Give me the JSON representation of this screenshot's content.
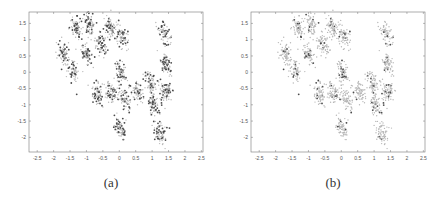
{
  "chart_data": [
    {
      "type": "scatter",
      "panel": "a",
      "caption": "(a)",
      "title": "",
      "xlabel": "",
      "ylabel": "",
      "xlim": [
        -2.75,
        2.55
      ],
      "ylim": [
        -2.45,
        1.85
      ],
      "xticks": [
        -2.5,
        -2,
        -1.5,
        -1,
        -0.5,
        0,
        0.5,
        1,
        1.5,
        2,
        2.5
      ],
      "yticks": [
        1.5,
        1,
        0.5,
        0,
        -0.5,
        -1,
        -1.5,
        -2
      ],
      "xtick_labels": [
        "-2.5",
        "-2",
        "-1.5",
        "-1",
        "-0.5",
        "0",
        "0.5",
        "1",
        "1.5",
        "2",
        "2.5"
      ],
      "ytick_labels": [
        "1.5",
        "1",
        "0.5",
        "0",
        "-0.5",
        "-1",
        "-1.5",
        "-2"
      ],
      "grid": false,
      "style": "dense gray points with many darker highlighted points",
      "clusters": [
        {
          "x": -1.3,
          "y": 1.35
        },
        {
          "x": -0.9,
          "y": 1.45
        },
        {
          "x": -1.7,
          "y": 0.55
        },
        {
          "x": -1.4,
          "y": 0.05
        },
        {
          "x": -1.0,
          "y": 0.55
        },
        {
          "x": -0.55,
          "y": 0.85
        },
        {
          "x": -0.25,
          "y": 1.35
        },
        {
          "x": 0.1,
          "y": 1.1
        },
        {
          "x": 1.35,
          "y": 1.2
        },
        {
          "x": 0.05,
          "y": 0.0
        },
        {
          "x": 1.4,
          "y": 0.25
        },
        {
          "x": 0.95,
          "y": -0.35
        },
        {
          "x": 1.4,
          "y": -0.55
        },
        {
          "x": -0.65,
          "y": -0.65
        },
        {
          "x": -0.25,
          "y": -0.65
        },
        {
          "x": 0.15,
          "y": -0.8
        },
        {
          "x": 0.55,
          "y": -0.6
        },
        {
          "x": 1.05,
          "y": -1.0
        },
        {
          "x": 0.05,
          "y": -1.7
        },
        {
          "x": 1.25,
          "y": -1.9
        }
      ]
    },
    {
      "type": "scatter",
      "panel": "b",
      "caption": "(b)",
      "title": "",
      "xlabel": "",
      "ylabel": "",
      "xlim": [
        -2.75,
        2.55
      ],
      "ylim": [
        -2.45,
        1.85
      ],
      "xticks": [
        -2.5,
        -2,
        -1.5,
        -1,
        -0.5,
        0,
        0.5,
        1,
        1.5,
        2,
        2.5
      ],
      "yticks": [
        1.5,
        1,
        0.5,
        0,
        -0.5,
        -1,
        -1.5,
        -2
      ],
      "xtick_labels": [
        "-2.5",
        "-2",
        "-1.5",
        "-1",
        "-0.5",
        "0",
        "0.5",
        "1",
        "1.5",
        "2",
        "2.5"
      ],
      "ytick_labels": [
        "1.5",
        "1",
        "0.5",
        "0",
        "-0.5",
        "-1",
        "-1.5",
        "-2"
      ],
      "grid": false,
      "style": "dense light gray points with few darker highlighted points",
      "clusters": [
        {
          "x": -1.3,
          "y": 1.35
        },
        {
          "x": -0.9,
          "y": 1.45
        },
        {
          "x": -1.7,
          "y": 0.55
        },
        {
          "x": -1.4,
          "y": 0.05
        },
        {
          "x": -1.0,
          "y": 0.55
        },
        {
          "x": -0.55,
          "y": 0.85
        },
        {
          "x": -0.25,
          "y": 1.35
        },
        {
          "x": 0.1,
          "y": 1.1
        },
        {
          "x": 1.35,
          "y": 1.2
        },
        {
          "x": 0.05,
          "y": 0.0
        },
        {
          "x": 1.4,
          "y": 0.25
        },
        {
          "x": 0.95,
          "y": -0.35
        },
        {
          "x": 1.4,
          "y": -0.55
        },
        {
          "x": -0.65,
          "y": -0.65
        },
        {
          "x": -0.25,
          "y": -0.65
        },
        {
          "x": 0.15,
          "y": -0.8
        },
        {
          "x": 0.55,
          "y": -0.6
        },
        {
          "x": 1.05,
          "y": -1.0
        },
        {
          "x": 0.05,
          "y": -1.7
        },
        {
          "x": 1.25,
          "y": -1.9
        }
      ]
    }
  ],
  "colors": {
    "axis": "#777777",
    "point_light": "#b8b8b8",
    "point_dark": "#4a4a4a"
  }
}
